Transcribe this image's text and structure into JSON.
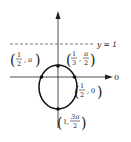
{
  "diagram": {
    "type": "polar conic (ellipse) with directrix",
    "directrix_label": "y = 1",
    "axis_label": "0",
    "points": [
      {
        "label_a": "1",
        "label_b": "2",
        "label_c": "π",
        "desc": "(1/2, π)"
      },
      {
        "label_a": "1",
        "label_b": "3",
        "label_c": "π",
        "label_d": "2",
        "desc": "(1/3, π/2)"
      },
      {
        "label_a": "1",
        "label_b": "2",
        "label_c": "0",
        "desc": "(1/2, 0)"
      },
      {
        "label_a": "1",
        "label_b": "3π",
        "label_c": "2",
        "desc": "(1, 3π/2)"
      }
    ]
  }
}
